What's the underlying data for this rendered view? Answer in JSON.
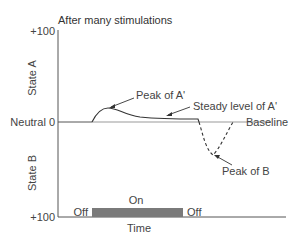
{
  "diagram": {
    "title": "After many stimulations",
    "y_axis": {
      "top_tick": "+100",
      "middle_tick": "Neutral 0",
      "bottom_tick": "+100",
      "upper_label": "State A",
      "lower_label": "State B"
    },
    "x_axis": {
      "label": "Time"
    },
    "annotations": {
      "peak_a": "Peak of A'",
      "steady_a": "Steady level of A'",
      "baseline": "Baseline",
      "peak_b": "Peak of B"
    },
    "stimulus": {
      "on_label": "On",
      "off_before_label": "Off",
      "off_after_label": "Off"
    },
    "colors": {
      "axis": "#555555",
      "curve": "#333333",
      "baseline": "#888888",
      "stimulus_bar": "#7a7a7a"
    }
  }
}
